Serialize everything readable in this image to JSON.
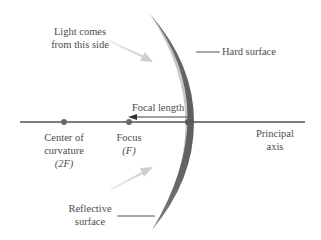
{
  "diagram": {
    "type": "concave-mirror",
    "labels": {
      "light": [
        "Light comes",
        "from this side"
      ],
      "hard_surface": "Hard surface",
      "focal_length": "Focal length",
      "center": [
        "Center of",
        "curvature",
        "(2F)"
      ],
      "focus": [
        "Focus",
        "(F)"
      ],
      "principal_axis": [
        "Principal",
        "axis"
      ],
      "reflective": [
        "Reflective",
        "surface"
      ]
    },
    "points": [
      {
        "name": "Center of curvature",
        "symbol": "2F"
      },
      {
        "name": "Focus",
        "symbol": "F"
      },
      {
        "name": "Vertex",
        "symbol": ""
      }
    ],
    "colors": {
      "mirror": "#6e6e6e",
      "axis": "#555555",
      "arrow_light": "#d6d6d6",
      "text": "#4d4d4d"
    }
  }
}
